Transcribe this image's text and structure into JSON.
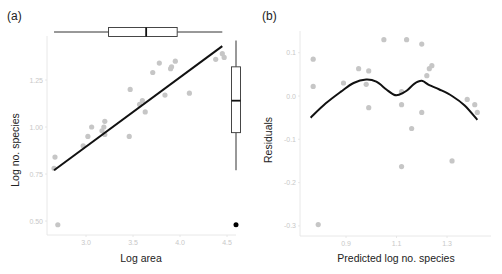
{
  "chart_data": [
    {
      "panel": "(a)",
      "type": "scatter",
      "xlabel": "Log area",
      "ylabel": "Log no. species",
      "xticks": [
        3.0,
        3.5,
        4.0,
        4.5
      ],
      "xtick_labels": [
        "3.0",
        "3.5",
        "4.0",
        "4.5"
      ],
      "yticks": [
        0.5,
        0.75,
        1.0,
        1.25
      ],
      "ytick_labels": [
        "0.50",
        "0.75",
        "1.00",
        "1.25"
      ],
      "xlim": [
        2.58,
        4.58
      ],
      "ylim": [
        0.46,
        1.41
      ],
      "grid": false,
      "points": [
        {
          "x": 2.67,
          "y": 0.84
        },
        {
          "x": 2.66,
          "y": 0.78
        },
        {
          "x": 2.7,
          "y": 0.48
        },
        {
          "x": 2.97,
          "y": 0.9
        },
        {
          "x": 3.02,
          "y": 0.95
        },
        {
          "x": 3.06,
          "y": 1.0
        },
        {
          "x": 3.17,
          "y": 0.98
        },
        {
          "x": 3.19,
          "y": 1.0
        },
        {
          "x": 3.2,
          "y": 1.03
        },
        {
          "x": 3.2,
          "y": 0.96
        },
        {
          "x": 3.46,
          "y": 0.95
        },
        {
          "x": 3.47,
          "y": 1.2
        },
        {
          "x": 3.57,
          "y": 1.12
        },
        {
          "x": 3.6,
          "y": 1.14
        },
        {
          "x": 3.63,
          "y": 1.08
        },
        {
          "x": 3.71,
          "y": 1.29
        },
        {
          "x": 3.78,
          "y": 1.34
        },
        {
          "x": 3.84,
          "y": 1.17
        },
        {
          "x": 3.9,
          "y": 1.31
        },
        {
          "x": 3.91,
          "y": 1.32
        },
        {
          "x": 3.95,
          "y": 1.35
        },
        {
          "x": 4.1,
          "y": 1.18
        },
        {
          "x": 4.38,
          "y": 1.36
        },
        {
          "x": 4.45,
          "y": 1.39
        },
        {
          "x": 4.47,
          "y": 1.37
        }
      ],
      "fit_line": {
        "x": [
          2.66,
          4.45
        ],
        "y": [
          0.77,
          1.43
        ]
      },
      "marginal_boxplot_x": {
        "min": 2.66,
        "q1": 3.24,
        "median": 3.64,
        "q3": 3.97,
        "max": 4.45
      },
      "marginal_boxplot_y": {
        "min": 0.77,
        "q1": 0.97,
        "median": 1.14,
        "q3": 1.32,
        "max": 1.46,
        "outliers": [
          0.48
        ]
      }
    },
    {
      "panel": "(b)",
      "type": "scatter",
      "xlabel": "Predicted log no. species",
      "ylabel": "Residuals",
      "xticks": [
        0.9,
        1.1,
        1.3
      ],
      "xtick_labels": [
        "0.9",
        "1.1",
        "1.3"
      ],
      "yticks": [
        0.1,
        0.0,
        -0.1,
        -0.2,
        -0.3
      ],
      "ytick_labels": [
        "0.1",
        "0.0",
        "-0.1",
        "-0.2",
        "-0.3"
      ],
      "xlim": [
        0.72,
        1.46
      ],
      "ylim": [
        -0.32,
        0.15
      ],
      "grid": false,
      "points": [
        {
          "x": 0.77,
          "y": 0.085
        },
        {
          "x": 0.77,
          "y": 0.022
        },
        {
          "x": 0.79,
          "y": -0.297
        },
        {
          "x": 0.89,
          "y": 0.03
        },
        {
          "x": 0.95,
          "y": 0.063
        },
        {
          "x": 0.98,
          "y": 0.027
        },
        {
          "x": 0.99,
          "y": -0.027
        },
        {
          "x": 0.99,
          "y": 0.058
        },
        {
          "x": 1.05,
          "y": 0.13
        },
        {
          "x": 1.12,
          "y": -0.02
        },
        {
          "x": 1.12,
          "y": 0.01
        },
        {
          "x": 1.12,
          "y": -0.163
        },
        {
          "x": 1.14,
          "y": 0.13
        },
        {
          "x": 1.16,
          "y": -0.075
        },
        {
          "x": 1.2,
          "y": -0.038
        },
        {
          "x": 1.2,
          "y": 0.12
        },
        {
          "x": 1.22,
          "y": 0.047
        },
        {
          "x": 1.23,
          "y": 0.063
        },
        {
          "x": 1.24,
          "y": 0.07
        },
        {
          "x": 1.32,
          "y": -0.15
        },
        {
          "x": 1.38,
          "y": -0.008
        },
        {
          "x": 1.41,
          "y": -0.02
        },
        {
          "x": 1.42,
          "y": -0.038
        }
      ],
      "smooth_curve": {
        "x": [
          0.76,
          0.82,
          0.88,
          0.93,
          0.98,
          1.02,
          1.06,
          1.09,
          1.11,
          1.14,
          1.17,
          1.2,
          1.23,
          1.27,
          1.32,
          1.37,
          1.42
        ],
        "y": [
          -0.05,
          -0.017,
          0.01,
          0.03,
          0.038,
          0.033,
          0.015,
          0.003,
          0.003,
          0.012,
          0.028,
          0.035,
          0.025,
          0.015,
          0.0,
          -0.022,
          -0.055
        ]
      }
    }
  ],
  "panels": {
    "a": {
      "label": "(a)",
      "xlabel": "Log area",
      "ylabel": "Log no. species"
    },
    "b": {
      "label": "(b)",
      "xlabel": "Predicted log no. species",
      "ylabel": "Residuals"
    }
  },
  "colors": {
    "points": "#c6c6c6",
    "line": "#111111",
    "axis": "#e2e2e2",
    "tick_text": "#c0c0c0",
    "box": "#333333",
    "outlier": "#000000"
  }
}
